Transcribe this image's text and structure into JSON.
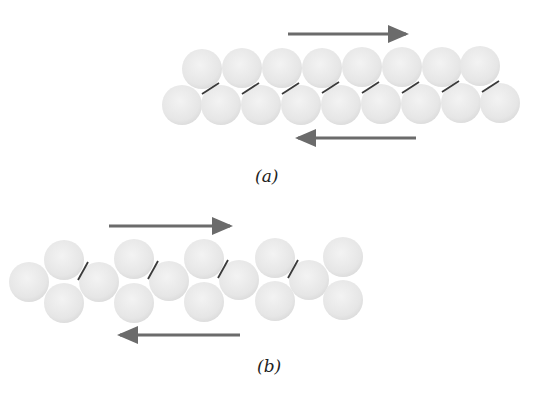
{
  "figure": {
    "panels": [
      {
        "id": "a",
        "label": "(a)",
        "description": "Two close-packed rows of atoms sliding past each other (shear)",
        "top_row_count": 8,
        "bottom_row_count": 9,
        "bond_count": 8,
        "top_arrow_direction": "right",
        "bottom_arrow_direction": "left"
      },
      {
        "id": "b",
        "label": "(b)",
        "description": "Zig-zag arrangement of atoms with bonds, under opposing shear forces",
        "middle_atoms": 5,
        "top_atoms": 5,
        "bottom_atoms": 5,
        "bond_count": 4,
        "top_arrow_direction": "right",
        "bottom_arrow_direction": "left"
      }
    ],
    "colors": {
      "atom_fill": "#e8e8e8",
      "atom_edge": "#d6d6d6",
      "bond": "#3a3a3a",
      "arrow": "#6b6b6b"
    }
  }
}
